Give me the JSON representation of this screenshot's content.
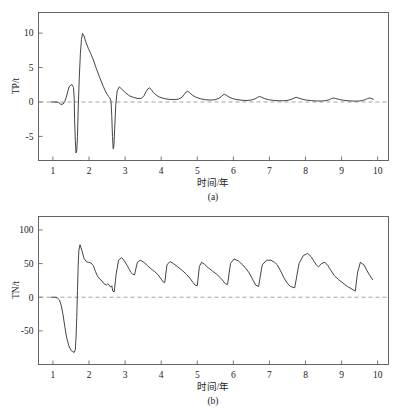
{
  "figure": {
    "background_color": "#ffffff",
    "line_color": "#3a3a3a",
    "axis_color": "#555555",
    "zeroline_color": "#9a9a9a"
  },
  "panels": [
    {
      "id": "a",
      "caption": "(a)",
      "ylabel": "TP/t",
      "xlabel": "时间/年",
      "ytick_labels": [
        "10",
        "5",
        "0",
        "-5"
      ],
      "xtick_labels": [
        "1",
        "2",
        "3",
        "4",
        "5",
        "6",
        "7",
        "8",
        "9",
        "10"
      ]
    },
    {
      "id": "b",
      "caption": "(b)",
      "ylabel": "TN/t",
      "xlabel": "时间/年",
      "ytick_labels": [
        "100",
        "50",
        "0",
        "-50"
      ],
      "xtick_labels": [
        "1",
        "2",
        "3",
        "4",
        "5",
        "6",
        "7",
        "8",
        "9",
        "10"
      ]
    }
  ],
  "chart_data": [
    {
      "type": "line",
      "panel": "a",
      "title": "",
      "xlabel": "时间/年",
      "ylabel": "TP/t",
      "xlim": [
        0.6,
        10.3
      ],
      "ylim": [
        -8.5,
        13.0
      ],
      "xticks": [
        1,
        2,
        3,
        4,
        5,
        6,
        7,
        8,
        9,
        10
      ],
      "yticks": [
        -5,
        0,
        5,
        10
      ],
      "grid": false,
      "legend": null,
      "zero_reference_line": 0,
      "series": [
        {
          "name": "TP",
          "x": [
            0.95,
            1.05,
            1.15,
            1.22,
            1.28,
            1.33,
            1.37,
            1.41,
            1.45,
            1.5,
            1.54,
            1.57,
            1.59,
            1.6,
            1.62,
            1.64,
            1.66,
            1.68,
            1.7,
            1.73,
            1.76,
            1.79,
            1.82,
            1.86,
            1.92,
            1.98,
            2.05,
            2.12,
            2.2,
            2.3,
            2.4,
            2.48,
            2.54,
            2.58,
            2.61,
            2.63,
            2.65,
            2.67,
            2.69,
            2.71,
            2.74,
            2.78,
            2.84,
            2.92,
            3.02,
            3.12,
            3.24,
            3.36,
            3.46,
            3.53,
            3.58,
            3.63,
            3.68,
            3.72,
            3.78,
            3.86,
            3.96,
            4.08,
            4.22,
            4.36,
            4.48,
            4.58,
            4.64,
            4.69,
            4.73,
            4.78,
            4.86,
            4.96,
            5.08,
            5.22,
            5.36,
            5.48,
            5.58,
            5.66,
            5.71,
            5.75,
            5.8,
            5.88,
            5.98,
            6.1,
            6.24,
            6.38,
            6.5,
            6.6,
            6.67,
            6.72,
            6.78,
            6.86,
            6.98,
            7.12,
            7.26,
            7.4,
            7.52,
            7.62,
            7.69,
            7.74,
            7.8,
            7.9,
            8.02,
            8.16,
            8.3,
            8.44,
            8.56,
            8.66,
            8.72,
            8.77,
            8.84,
            8.94,
            9.06,
            9.2,
            9.34,
            9.48,
            9.58,
            9.66,
            9.72,
            9.77,
            9.82,
            9.88
          ],
          "y": [
            0.0,
            0.0,
            -0.05,
            -0.35,
            -0.3,
            0.1,
            0.7,
            1.5,
            2.2,
            2.5,
            2.45,
            2.1,
            0.5,
            -2.5,
            -5.6,
            -7.4,
            -7.1,
            -5.0,
            -1.0,
            3.5,
            7.0,
            9.1,
            9.95,
            9.6,
            8.6,
            7.8,
            7.0,
            6.1,
            4.9,
            3.5,
            2.2,
            1.3,
            0.8,
            0.55,
            0.1,
            -2.0,
            -5.0,
            -6.8,
            -6.4,
            -4.0,
            -0.5,
            1.6,
            2.2,
            1.8,
            1.3,
            0.9,
            0.65,
            0.5,
            0.55,
            0.95,
            1.5,
            1.9,
            2.05,
            1.85,
            1.4,
            1.0,
            0.7,
            0.5,
            0.38,
            0.35,
            0.42,
            0.7,
            1.1,
            1.45,
            1.55,
            1.4,
            1.0,
            0.7,
            0.48,
            0.33,
            0.28,
            0.32,
            0.48,
            0.75,
            1.0,
            1.12,
            1.0,
            0.72,
            0.5,
            0.35,
            0.25,
            0.22,
            0.28,
            0.45,
            0.68,
            0.8,
            0.7,
            0.5,
            0.33,
            0.23,
            0.18,
            0.18,
            0.25,
            0.4,
            0.58,
            0.68,
            0.6,
            0.42,
            0.28,
            0.2,
            0.15,
            0.14,
            0.2,
            0.33,
            0.5,
            0.58,
            0.5,
            0.36,
            0.24,
            0.17,
            0.13,
            0.14,
            0.22,
            0.35,
            0.5,
            0.58,
            0.52,
            0.4
          ]
        }
      ]
    },
    {
      "type": "line",
      "panel": "b",
      "title": "",
      "xlabel": "时间/年",
      "ylabel": "TN/t",
      "xlim": [
        0.6,
        10.3
      ],
      "ylim": [
        -100,
        120
      ],
      "xticks": [
        1,
        2,
        3,
        4,
        5,
        6,
        7,
        8,
        9,
        10
      ],
      "yticks": [
        -50,
        0,
        50,
        100
      ],
      "grid": false,
      "legend": null,
      "zero_reference_line": 0,
      "series": [
        {
          "name": "TN",
          "x": [
            0.95,
            1.05,
            1.12,
            1.18,
            1.23,
            1.28,
            1.33,
            1.38,
            1.44,
            1.5,
            1.55,
            1.59,
            1.62,
            1.64,
            1.66,
            1.68,
            1.7,
            1.72,
            1.75,
            1.8,
            1.86,
            1.92,
            1.98,
            2.05,
            2.12,
            2.18,
            2.24,
            2.3,
            2.36,
            2.42,
            2.48,
            2.52,
            2.56,
            2.6,
            2.63,
            2.66,
            2.7,
            2.75,
            2.82,
            2.9,
            2.98,
            3.06,
            3.12,
            3.16,
            3.2,
            3.26,
            3.34,
            3.42,
            3.52,
            3.62,
            3.72,
            3.82,
            3.92,
            4.0,
            4.05,
            4.1,
            4.16,
            4.24,
            4.34,
            4.46,
            4.58,
            4.7,
            4.8,
            4.88,
            4.94,
            5.0,
            5.06,
            5.12,
            5.2,
            5.3,
            5.42,
            5.54,
            5.64,
            5.72,
            5.78,
            5.84,
            5.92,
            6.02,
            6.14,
            6.26,
            6.36,
            6.44,
            6.5,
            6.56,
            6.62,
            6.7,
            6.8,
            6.92,
            7.04,
            7.14,
            7.22,
            7.28,
            7.34,
            7.4,
            7.48,
            7.58,
            7.7,
            7.82,
            7.94,
            8.06,
            8.16,
            8.24,
            8.3,
            8.36,
            8.44,
            8.54,
            8.62,
            8.7,
            8.8,
            8.92,
            9.04,
            9.16,
            9.26,
            9.32,
            9.38,
            9.44,
            9.52,
            9.62,
            9.74,
            9.86
          ],
          "y": [
            0.0,
            0.0,
            -1.0,
            -4.0,
            -12.0,
            -26.0,
            -44.0,
            -60.0,
            -72.0,
            -79.0,
            -81.0,
            -82.0,
            -78.0,
            -60.0,
            -30.0,
            10.0,
            48.0,
            70.0,
            78.0,
            70.0,
            58.0,
            53.0,
            52.0,
            51.0,
            47.0,
            38.0,
            31.0,
            27.0,
            24.0,
            20.0,
            18.0,
            20.0,
            18.0,
            15.0,
            17.0,
            9.0,
            8.0,
            34.0,
            55.0,
            59.0,
            54.0,
            47.0,
            41.0,
            37.0,
            35.0,
            33.0,
            52.0,
            55.0,
            52.0,
            47.0,
            42.0,
            38.0,
            33.0,
            27.0,
            23.0,
            22.0,
            48.0,
            53.0,
            50.0,
            45.0,
            40.0,
            34.0,
            28.0,
            22.0,
            18.0,
            17.0,
            46.0,
            52.0,
            49.0,
            44.0,
            39.0,
            34.0,
            29.0,
            24.0,
            20.0,
            19.0,
            50.0,
            57.0,
            54.0,
            48.0,
            42.0,
            36.0,
            30.0,
            24.0,
            18.0,
            16.0,
            48.0,
            55.0,
            55.0,
            52.0,
            48.0,
            42.0,
            36.0,
            29.0,
            22.0,
            16.0,
            14.0,
            50.0,
            62.0,
            65.0,
            60.0,
            53.0,
            48.0,
            45.0,
            50.0,
            52.0,
            47.0,
            40.0,
            32.0,
            26.0,
            21.0,
            16.0,
            13.0,
            11.0,
            9.0,
            36.0,
            52.0,
            48.0,
            36.0,
            26.0
          ]
        }
      ]
    }
  ]
}
